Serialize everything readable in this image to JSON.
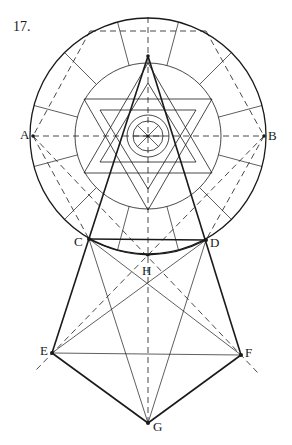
{
  "figure": {
    "number": "17.",
    "points": {
      "A": "A",
      "B": "B",
      "C": "C",
      "D": "D",
      "E": "E",
      "F": "F",
      "G": "G",
      "H": "H"
    }
  },
  "colors": {
    "ink": "#1a1a1a",
    "background": "#ffffff"
  }
}
